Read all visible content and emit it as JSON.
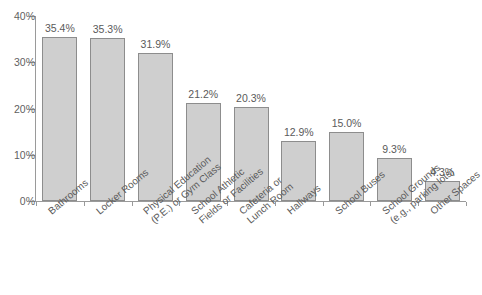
{
  "chart_data": {
    "type": "bar",
    "title": "",
    "subtitle": "",
    "xlabel": "",
    "ylabel": "",
    "ylim": [
      0,
      40
    ],
    "grid": false,
    "legend": false,
    "y_ticks": [
      "0%",
      "10%",
      "20%",
      "30%",
      "40%"
    ],
    "y_tick_values": [
      0,
      10,
      20,
      30,
      40
    ],
    "categories": [
      "Bathrooms",
      "Locker Rooms",
      "Physical Education (P.E.) or Gym Class",
      "School Athletic Fields or Facilities",
      "Cafeteria or Lunch Room",
      "Hallways",
      "School Buses",
      "School Grounds (e.g., parking lots)",
      "Other Spaces"
    ],
    "category_lines": [
      [
        "Bathrooms",
        ""
      ],
      [
        "Locker Rooms",
        ""
      ],
      [
        "Physical Education",
        "(P.E.) or Gym Class"
      ],
      [
        "School Athletic",
        "Fields or Facilities"
      ],
      [
        "Cafeteria or",
        "Lunch Room"
      ],
      [
        "Hallways",
        ""
      ],
      [
        "School Buses",
        ""
      ],
      [
        "School Grounds",
        "(e.g., parking lots)"
      ],
      [
        "Other Spaces",
        ""
      ]
    ],
    "values": [
      35.4,
      35.3,
      31.9,
      21.2,
      20.3,
      12.9,
      15.0,
      9.3,
      4.3
    ],
    "value_labels": [
      "35.4%",
      "35.3%",
      "31.9%",
      "21.2%",
      "20.3%",
      "12.9%",
      "15.0%",
      "9.3%",
      "4.3%"
    ],
    "colors": {
      "bar_fill": "#cfcfcf",
      "bar_border": "#8d8d8d",
      "axis": "#9a9a9a",
      "text": "#5a5a5a",
      "background": "#ffffff"
    }
  }
}
